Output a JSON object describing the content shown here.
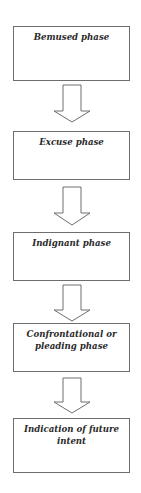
{
  "diagram": {
    "type": "vertical-flowchart",
    "nodes": [
      {
        "id": "bemused",
        "label": "Bemused phase"
      },
      {
        "id": "excuse",
        "label": "Excuse phase"
      },
      {
        "id": "indignant",
        "label": "Indignant phase"
      },
      {
        "id": "confrontational",
        "label": "Confrontational or pleading phase"
      },
      {
        "id": "future-intent",
        "label": "Indication of future intent"
      }
    ],
    "edges": [
      {
        "from": "bemused",
        "to": "excuse",
        "style": "hollow-block-arrow"
      },
      {
        "from": "excuse",
        "to": "indignant",
        "style": "hollow-block-arrow"
      },
      {
        "from": "indignant",
        "to": "confrontational",
        "style": "hollow-block-arrow"
      },
      {
        "from": "confrontational",
        "to": "future-intent",
        "style": "hollow-block-arrow"
      }
    ]
  }
}
